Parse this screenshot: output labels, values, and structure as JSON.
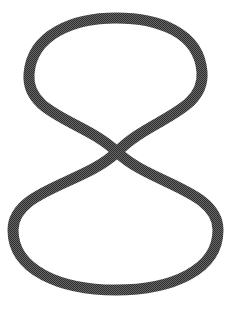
{
  "canvas": {
    "width": 229,
    "height": 311,
    "background_color": "#ffffff"
  },
  "figure": {
    "name": "figure-eight-loop",
    "stroke_color": "#2e2e2e",
    "fill": "none",
    "stroke_width": 11,
    "stroke_linecap": "round",
    "stroke_linejoin": "round",
    "texture": "halftone-dither"
  },
  "chart_data": {
    "type": "line",
    "title": "",
    "subtitle": "",
    "xlabel": "",
    "ylabel": "",
    "grid": false,
    "legend_position": "none",
    "xlim": [
      0,
      229
    ],
    "ylim": [
      0,
      311
    ],
    "annotations": [],
    "series": [
      {
        "name": "figure-eight-outline",
        "closed": true,
        "stroke_color": "#2e2e2e",
        "stroke_width": 11,
        "path": "M 117 152 C 150 118 205 112 202 72 C 199 32 158 18 116 18 C 74 18 32 34 29 74 C 26 115 84 120 117 152 C 150 184 218 190 218 230 C 218 270 172 290 116 290 C 60 290 13 270 13 230 C 13 190 84 184 117 152 Z",
        "key_points": [
          {
            "label": "crossing-point",
            "x": 117,
            "y": 152
          },
          {
            "label": "top-loop-apex",
            "x": 116,
            "y": 18
          },
          {
            "label": "top-loop-left",
            "x": 29,
            "y": 74
          },
          {
            "label": "top-loop-right",
            "x": 202,
            "y": 72
          },
          {
            "label": "bottom-loop-base",
            "x": 116,
            "y": 290
          },
          {
            "label": "bottom-loop-left",
            "x": 13,
            "y": 230
          },
          {
            "label": "bottom-loop-right",
            "x": 218,
            "y": 230
          }
        ]
      }
    ],
    "measurements": {
      "top_loop_width": 173,
      "top_loop_height": 134,
      "bottom_loop_width": 205,
      "bottom_loop_height": 138,
      "total_width": 205,
      "total_height": 272
    }
  }
}
